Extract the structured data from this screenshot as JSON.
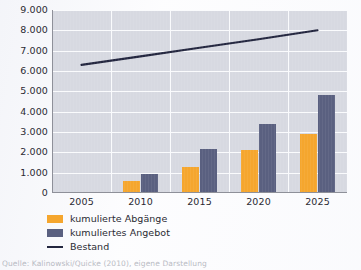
{
  "chart_data": {
    "type": "bar",
    "title": "",
    "xlabel": "",
    "ylabel": "",
    "categories": [
      "2005",
      "2010",
      "2015",
      "2020",
      "2025"
    ],
    "ylim": [
      0,
      9000
    ],
    "ytick_step": 1000,
    "ytick_labels": [
      "9.000",
      "8.000",
      "7.000",
      "6.000",
      "5.000",
      "4.000",
      "3.000",
      "2.000",
      "1.000",
      "0"
    ],
    "ytick_values": [
      9000,
      8000,
      7000,
      6000,
      5000,
      4000,
      3000,
      2000,
      1000,
      0
    ],
    "grid": true,
    "legend_position": "below-left",
    "series": [
      {
        "name": "kumulierte Abgänge",
        "type": "bar",
        "color": "#f5a62e",
        "values": [
          null,
          600,
          1300,
          2100,
          2900
        ]
      },
      {
        "name": "kumuliertes Angebot",
        "type": "bar",
        "color": "#5a6080",
        "values": [
          null,
          950,
          2150,
          3400,
          4800
        ]
      },
      {
        "name": "Bestand",
        "type": "line",
        "color": "#23263f",
        "values": [
          6300,
          6720,
          7140,
          7560,
          8000
        ]
      }
    ]
  },
  "legend": {
    "items": [
      {
        "label": "kumulierte Abgänge",
        "swatch": "abgaenge"
      },
      {
        "label": "kumuliertes Angebot",
        "swatch": "angebot"
      },
      {
        "label": "Bestand",
        "swatch": "line"
      }
    ]
  },
  "source": {
    "text": "Quelle: Kalinowski/Quicke (2010), eigene Darstellung"
  }
}
